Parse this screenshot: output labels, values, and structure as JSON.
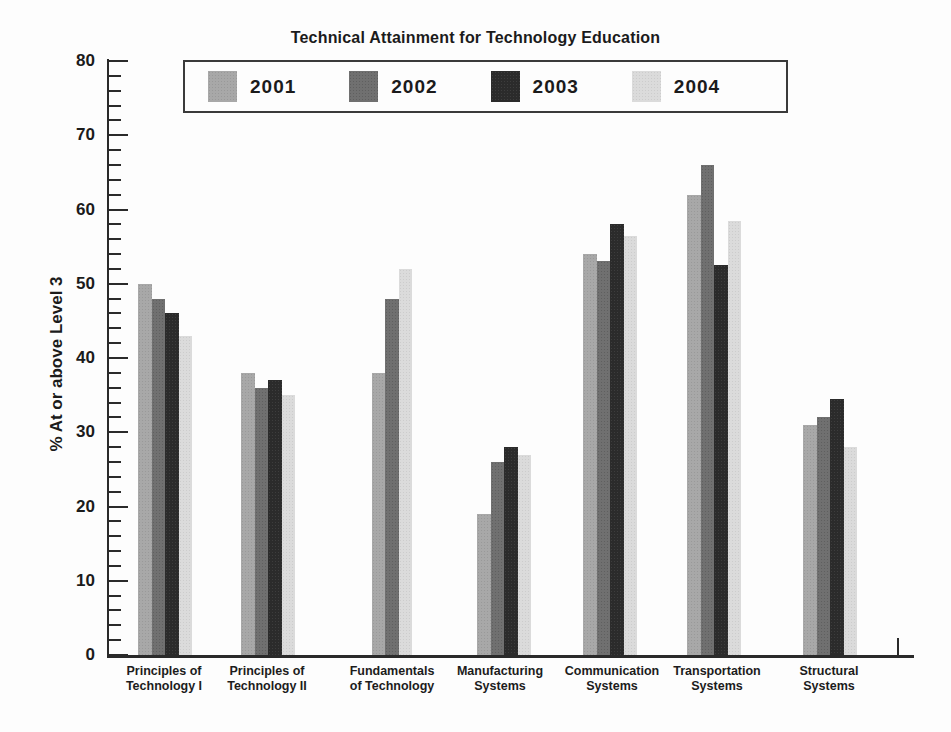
{
  "chart_data": {
    "type": "bar",
    "title": "Technical Attainment for Technology Education",
    "xlabel": "",
    "ylabel": "% At or above Level 3",
    "ylim": [
      0,
      80
    ],
    "y_major_ticks": [
      0,
      10,
      20,
      30,
      40,
      50,
      60,
      70,
      80
    ],
    "y_minor_tick_step": 2,
    "grid": false,
    "legend_position": "top-center",
    "categories": [
      "Principles of Technology I",
      "Principles of Technology II",
      "Fundamentals of Technology",
      "Manufacturing Systems",
      "Communication Systems",
      "Transportation Systems",
      "Structural Systems"
    ],
    "category_lines": [
      [
        "Principles of",
        "Technology I"
      ],
      [
        "Principles of",
        "Technology II"
      ],
      [
        "Fundamentals",
        "of Technology"
      ],
      [
        "Manufacturing",
        "Systems"
      ],
      [
        "Communication",
        "Systems"
      ],
      [
        "Transportation",
        "Systems"
      ],
      [
        "Structural",
        "Systems"
      ]
    ],
    "series": [
      {
        "name": "2001",
        "color": "#a8a8a8",
        "dot_color": "#999999",
        "values": [
          50,
          38,
          38,
          19,
          54,
          62,
          31
        ]
      },
      {
        "name": "2002",
        "color": "#707070",
        "dot_color": "#5f5f5f",
        "values": [
          48,
          36,
          48,
          26,
          53,
          66,
          32
        ]
      },
      {
        "name": "2003",
        "color": "#2b2b2b",
        "dot_color": "#3d3d3d",
        "values": [
          46,
          37,
          null,
          28,
          58,
          52.5,
          34.5
        ]
      },
      {
        "name": "2004",
        "color": "#dbdbdb",
        "dot_color": "#cccccc",
        "values": [
          43,
          35,
          52,
          27,
          56.5,
          58.5,
          28
        ]
      }
    ]
  },
  "colors": {
    "axis": "#2a2a2a",
    "text": "#1b1b1b",
    "background": "#fdfdfd",
    "legend_border": "#3a3a3a"
  }
}
